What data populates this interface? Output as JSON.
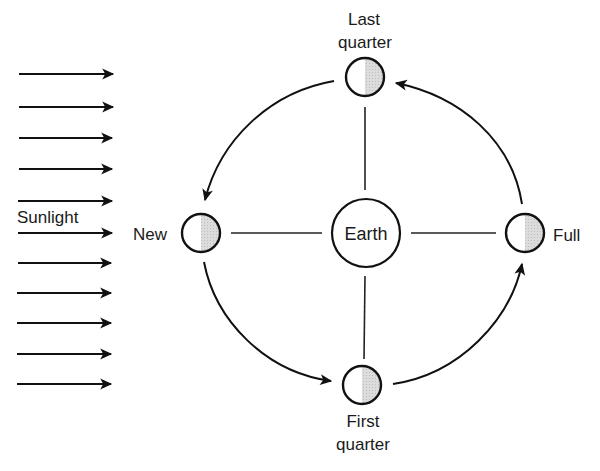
{
  "diagram": {
    "sunlight_label": "Sunlight",
    "sunlight_arrow_count": 11,
    "earth_label": "Earth",
    "phases": [
      {
        "id": "last-quarter",
        "label_line1": "Last",
        "label_line2": "quarter"
      },
      {
        "id": "new",
        "label_line1": "New"
      },
      {
        "id": "full",
        "label_line1": "Full"
      },
      {
        "id": "first-quarter",
        "label_line1": "First",
        "label_line2": "quarter"
      }
    ],
    "orbit_direction": "counterclockwise",
    "colors": {
      "stroke": "#111111",
      "shadow_fill": "#d8d8d8",
      "background": "#ffffff"
    }
  }
}
